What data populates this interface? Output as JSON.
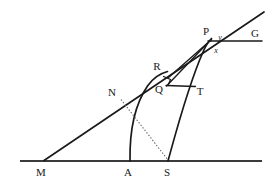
{
  "diagram": {
    "background_color": "#ffffff",
    "line_color": "#1a1a1a",
    "dotted_color": "#666666",
    "points": [
      {
        "id": "M",
        "label": "M",
        "x": 44,
        "y": 161,
        "label_x": 41,
        "label_y": 176
      },
      {
        "id": "A",
        "label": "A",
        "x": 130,
        "y": 161,
        "label_x": 126,
        "label_y": 176
      },
      {
        "id": "S",
        "label": "S",
        "x": 168,
        "y": 161,
        "label_x": 164,
        "label_y": 176
      },
      {
        "id": "N",
        "label": "N",
        "x": 122,
        "y": 100,
        "label_x": 110,
        "label_y": 95
      },
      {
        "id": "Q",
        "label": "Q",
        "x": 166,
        "y": 85,
        "label_x": 158,
        "label_y": 92
      },
      {
        "id": "T",
        "label": "T",
        "x": 195,
        "y": 86,
        "label_x": 198,
        "label_y": 95
      },
      {
        "id": "R",
        "label": "R",
        "x": 167,
        "y": 72,
        "label_x": 155,
        "label_y": 70
      },
      {
        "id": "P",
        "label": "P",
        "x": 212,
        "y": 38,
        "label_x": 205,
        "label_y": 35
      },
      {
        "id": "G",
        "label": "G",
        "x": 262,
        "y": 40,
        "label_x": 253,
        "label_y": 37
      }
    ],
    "angle_labels": [
      {
        "id": "y",
        "label": "y",
        "x": 221,
        "y": 39
      },
      {
        "id": "x",
        "label": "x",
        "x": 217,
        "y": 52
      }
    ],
    "segments": [
      {
        "id": "baseline-MG",
        "from": "M",
        "to": "G",
        "style": "solid",
        "width": 1.6
      },
      {
        "id": "ray-M-to-upper",
        "from": "M",
        "to": "upper-end",
        "style": "solid",
        "width": 1.6
      },
      {
        "id": "chord-P-G",
        "from": "P",
        "to": "G",
        "style": "solid",
        "width": 1.4
      },
      {
        "id": "segment-Q-T",
        "from": "Q",
        "to": "T",
        "style": "solid",
        "width": 1.3
      },
      {
        "id": "segment-Q-P",
        "from": "Q",
        "to": "P",
        "style": "solid",
        "width": 1.3
      },
      {
        "id": "segment-R-P",
        "from": "R",
        "to": "P",
        "style": "solid",
        "width": 1.3
      },
      {
        "id": "dotted-N-S",
        "from": "N",
        "to": "S",
        "style": "dotted",
        "width": 1.0
      }
    ],
    "arcs": [
      {
        "id": "arc-A-to-R",
        "from": "A",
        "to": "R",
        "center": "S",
        "note": "circular arc centred at S through A and R"
      },
      {
        "id": "arc-S-to-P",
        "from": "S",
        "to": "P",
        "note": "curve from S rising to P"
      }
    ],
    "markers": [
      {
        "id": "right-angle-at-Q",
        "type": "right-angle-square",
        "vertex": "Q"
      }
    ]
  }
}
